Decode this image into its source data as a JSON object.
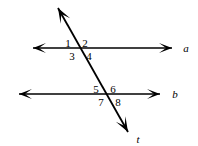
{
  "figure": {
    "stroke_color": "#000000",
    "background_color": "#ffffff",
    "lines": [
      {
        "id": "line-a",
        "label": "a",
        "kind": "parallel-line",
        "x1": 33,
        "y1": 48,
        "x2": 172,
        "y2": 48,
        "arrow_start": true,
        "arrow_end": true,
        "label_x": 186,
        "label_y": 43
      },
      {
        "id": "line-b",
        "label": "b",
        "kind": "parallel-line",
        "x1": 19,
        "y1": 94,
        "x2": 160,
        "y2": 94,
        "arrow_start": true,
        "arrow_end": true,
        "label_x": 175,
        "label_y": 89
      },
      {
        "id": "line-t",
        "label": "t",
        "kind": "transversal",
        "x1": 58,
        "y1": 8,
        "x2": 128,
        "y2": 132,
        "arrow_start": true,
        "arrow_end": true,
        "label_x": 138,
        "label_y": 134
      }
    ],
    "intersections": [
      {
        "id": "intersection-a-t",
        "x": 79,
        "y": 48
      },
      {
        "id": "intersection-b-t",
        "x": 107,
        "y": 94
      }
    ],
    "angle_labels": [
      {
        "id": "angle-1",
        "text": "1",
        "x": 68,
        "y": 38,
        "position": "upper-left",
        "at": "intersection-a-t"
      },
      {
        "id": "angle-2",
        "text": "2",
        "x": 85,
        "y": 38,
        "position": "upper-right",
        "at": "intersection-a-t"
      },
      {
        "id": "angle-3",
        "text": "3",
        "x": 72,
        "y": 51,
        "position": "lower-left",
        "at": "intersection-a-t"
      },
      {
        "id": "angle-4",
        "text": "4",
        "x": 89,
        "y": 51,
        "position": "lower-right",
        "at": "intersection-a-t"
      },
      {
        "id": "angle-5",
        "text": "5",
        "x": 96,
        "y": 84,
        "position": "upper-left",
        "at": "intersection-b-t"
      },
      {
        "id": "angle-6",
        "text": "6",
        "x": 113,
        "y": 84,
        "position": "upper-right",
        "at": "intersection-b-t"
      },
      {
        "id": "angle-7",
        "text": "7",
        "x": 101,
        "y": 97,
        "position": "lower-left",
        "at": "intersection-b-t"
      },
      {
        "id": "angle-8",
        "text": "8",
        "x": 118,
        "y": 97,
        "position": "lower-right",
        "at": "intersection-b-t"
      }
    ]
  }
}
